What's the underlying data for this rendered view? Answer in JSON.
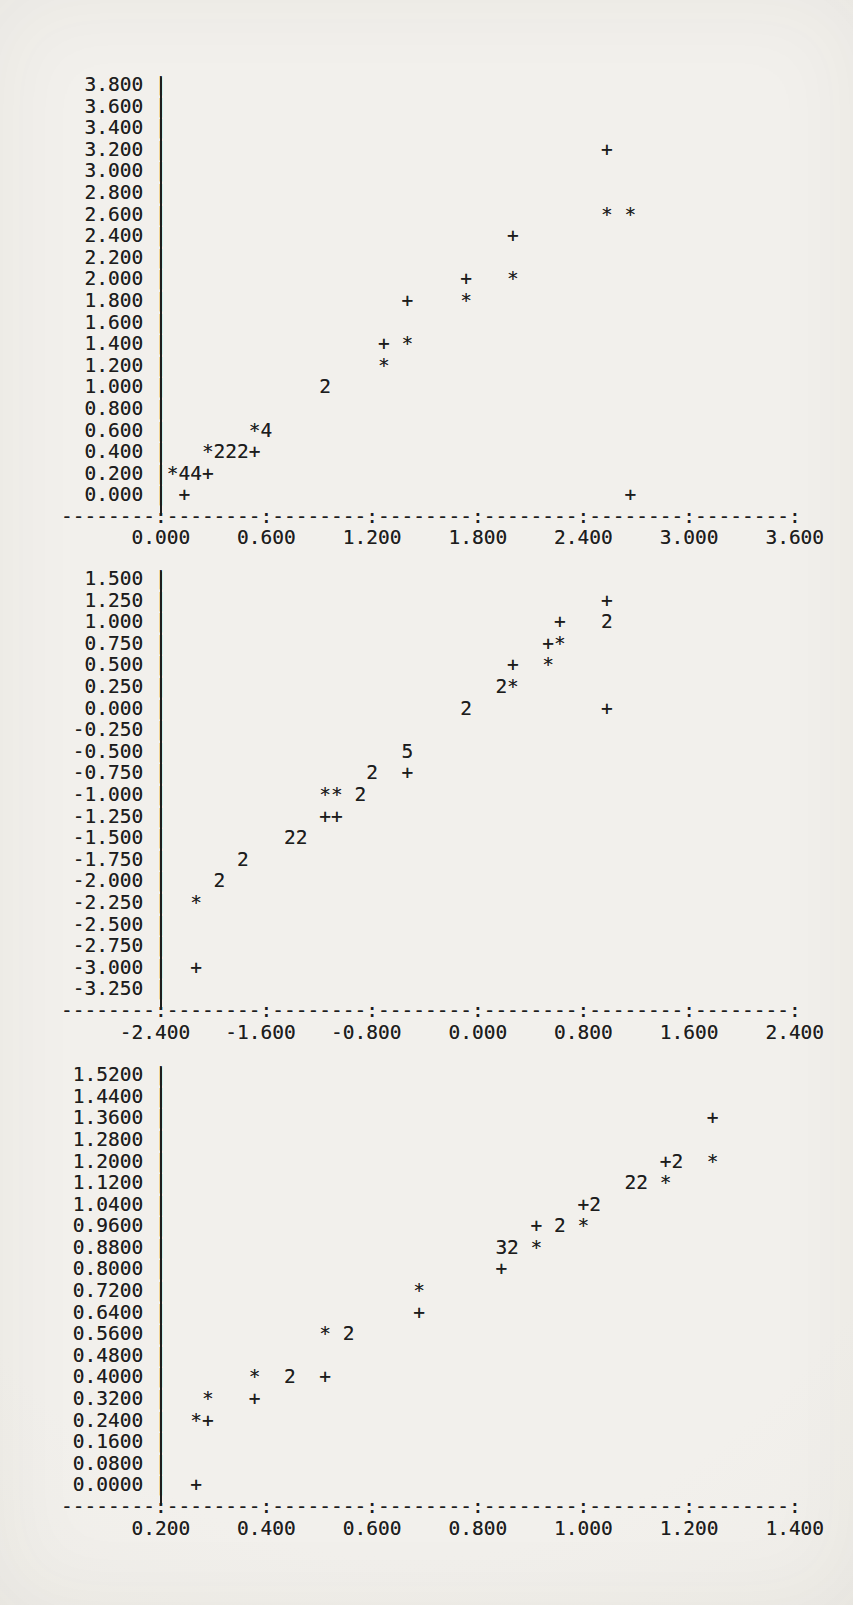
{
  "page": {
    "background": "#f0eeea",
    "ink": "#1d1d1d"
  },
  "plots": [
    {
      "id": "plot-1",
      "axis_line": "--------:--------:--------:--------:--------:--------:--------:",
      "x_label_line": "      0.000    0.600    1.200    1.800    2.400    3.000    3.600",
      "rows": [
        {
          "label": "3.800",
          "marks": []
        },
        {
          "label": "3.600",
          "marks": []
        },
        {
          "label": "3.400",
          "marks": []
        },
        {
          "label": "3.200",
          "marks": [
            [
              46,
              "+"
            ]
          ]
        },
        {
          "label": "3.000",
          "marks": []
        },
        {
          "label": "2.800",
          "marks": []
        },
        {
          "label": "2.600",
          "marks": [
            [
              46,
              "*"
            ],
            [
              48,
              "*"
            ]
          ]
        },
        {
          "label": "2.400",
          "marks": [
            [
              38,
              "+"
            ]
          ]
        },
        {
          "label": "2.200",
          "marks": []
        },
        {
          "label": "2.000",
          "marks": [
            [
              34,
              "+"
            ],
            [
              38,
              "*"
            ]
          ]
        },
        {
          "label": "1.800",
          "marks": [
            [
              29,
              "+"
            ],
            [
              34,
              "*"
            ]
          ]
        },
        {
          "label": "1.600",
          "marks": []
        },
        {
          "label": "1.400",
          "marks": [
            [
              27,
              "+"
            ],
            [
              29,
              "*"
            ]
          ]
        },
        {
          "label": "1.200",
          "marks": [
            [
              27,
              "*"
            ]
          ]
        },
        {
          "label": "1.000",
          "marks": [
            [
              22,
              "2"
            ]
          ]
        },
        {
          "label": "0.800",
          "marks": []
        },
        {
          "label": "0.600",
          "marks": [
            [
              16,
              "*4"
            ]
          ]
        },
        {
          "label": "0.400",
          "marks": [
            [
              12,
              "*222+"
            ]
          ]
        },
        {
          "label": "0.200",
          "marks": [
            [
              9,
              "*44+"
            ]
          ]
        },
        {
          "label": "0.000",
          "marks": [
            [
              10,
              "+"
            ],
            [
              48,
              "+"
            ]
          ]
        }
      ]
    },
    {
      "id": "plot-2",
      "axis_line": "--------:--------:--------:--------:--------:--------:--------:",
      "x_label_line": "     -2.400   -1.600   -0.800    0.000    0.800    1.600    2.400",
      "rows": [
        {
          "label": "1.500",
          "marks": []
        },
        {
          "label": "1.250",
          "marks": [
            [
              46,
              "+"
            ]
          ]
        },
        {
          "label": "1.000",
          "marks": [
            [
              42,
              "+"
            ],
            [
              46,
              "2"
            ]
          ]
        },
        {
          "label": "0.750",
          "marks": [
            [
              41,
              "+*"
            ]
          ]
        },
        {
          "label": "0.500",
          "marks": [
            [
              38,
              "+"
            ],
            [
              41,
              "*"
            ]
          ]
        },
        {
          "label": "0.250",
          "marks": [
            [
              37,
              "2*"
            ]
          ]
        },
        {
          "label": "0.000",
          "marks": [
            [
              34,
              "2"
            ],
            [
              46,
              "+"
            ]
          ]
        },
        {
          "label": "-0.250",
          "marks": []
        },
        {
          "label": "-0.500",
          "marks": [
            [
              29,
              "5"
            ]
          ]
        },
        {
          "label": "-0.750",
          "marks": [
            [
              26,
              "2"
            ],
            [
              29,
              "+"
            ]
          ]
        },
        {
          "label": "-1.000",
          "marks": [
            [
              22,
              "**"
            ],
            [
              25,
              "2"
            ]
          ]
        },
        {
          "label": "-1.250",
          "marks": [
            [
              22,
              "++"
            ]
          ]
        },
        {
          "label": "-1.500",
          "marks": [
            [
              19,
              "22"
            ]
          ]
        },
        {
          "label": "-1.750",
          "marks": [
            [
              15,
              "2"
            ]
          ]
        },
        {
          "label": "-2.000",
          "marks": [
            [
              13,
              "2"
            ]
          ]
        },
        {
          "label": "-2.250",
          "marks": [
            [
              11,
              "*"
            ]
          ]
        },
        {
          "label": "-2.500",
          "marks": []
        },
        {
          "label": "-2.750",
          "marks": []
        },
        {
          "label": "-3.000",
          "marks": [
            [
              11,
              "+"
            ]
          ]
        },
        {
          "label": "-3.250",
          "marks": []
        }
      ]
    },
    {
      "id": "plot-3",
      "axis_line": "--------:--------:--------:--------:--------:--------:--------:",
      "x_label_line": "      0.200    0.400    0.600    0.800    1.000    1.200    1.400",
      "rows": [
        {
          "label": "1.5200",
          "marks": []
        },
        {
          "label": "1.4400",
          "marks": []
        },
        {
          "label": "1.3600",
          "marks": [
            [
              55,
              "+"
            ]
          ]
        },
        {
          "label": "1.2800",
          "marks": []
        },
        {
          "label": "1.2000",
          "marks": [
            [
              51,
              "+2"
            ],
            [
              55,
              "*"
            ]
          ]
        },
        {
          "label": "1.1200",
          "marks": [
            [
              48,
              "22"
            ],
            [
              51,
              "*"
            ]
          ]
        },
        {
          "label": "1.0400",
          "marks": [
            [
              44,
              "+2"
            ]
          ]
        },
        {
          "label": "0.9600",
          "marks": [
            [
              40,
              "+"
            ],
            [
              42,
              "2"
            ],
            [
              44,
              "*"
            ]
          ]
        },
        {
          "label": "0.8800",
          "marks": [
            [
              37,
              "32"
            ],
            [
              40,
              "*"
            ]
          ]
        },
        {
          "label": "0.8000",
          "marks": [
            [
              37,
              "+"
            ]
          ]
        },
        {
          "label": "0.7200",
          "marks": [
            [
              30,
              "*"
            ]
          ]
        },
        {
          "label": "0.6400",
          "marks": [
            [
              30,
              "+"
            ]
          ]
        },
        {
          "label": "0.5600",
          "marks": [
            [
              22,
              "*"
            ],
            [
              24,
              "2"
            ]
          ]
        },
        {
          "label": "0.4800",
          "marks": []
        },
        {
          "label": "0.4000",
          "marks": [
            [
              16,
              "*"
            ],
            [
              19,
              "2"
            ],
            [
              22,
              "+"
            ]
          ]
        },
        {
          "label": "0.3200",
          "marks": [
            [
              12,
              "*"
            ],
            [
              16,
              "+"
            ]
          ]
        },
        {
          "label": "0.2400",
          "marks": [
            [
              11,
              "*+"
            ]
          ]
        },
        {
          "label": "0.1600",
          "marks": []
        },
        {
          "label": "0.0800",
          "marks": []
        },
        {
          "label": "0.0000",
          "marks": [
            [
              11,
              "+"
            ]
          ]
        }
      ]
    }
  ],
  "chart_data": [
    {
      "type": "scatter",
      "title": "",
      "xlabel": "",
      "ylabel": "",
      "xlim": [
        0.0,
        3.6
      ],
      "ylim": [
        0.0,
        3.8
      ],
      "x_ticks": [
        0.0,
        0.6,
        1.2,
        1.8,
        2.4,
        3.0,
        3.6
      ],
      "y_ticks": [
        3.8,
        3.6,
        3.4,
        3.2,
        3.0,
        2.8,
        2.6,
        2.4,
        2.2,
        2.0,
        1.8,
        1.6,
        1.4,
        1.2,
        1.0,
        0.8,
        0.6,
        0.4,
        0.2,
        0.0
      ],
      "grid": false,
      "legend": "none",
      "marker_note": "printer plot: + and * are single points; a digit n marks n coincident points",
      "point_format": "[x, y, marker]",
      "points": [
        [
          2.53,
          3.2,
          "+"
        ],
        [
          2.53,
          2.6,
          "*"
        ],
        [
          2.67,
          2.6,
          "*"
        ],
        [
          2.0,
          2.4,
          "+"
        ],
        [
          1.73,
          2.0,
          "+"
        ],
        [
          2.0,
          2.0,
          "*"
        ],
        [
          1.4,
          1.8,
          "+"
        ],
        [
          1.73,
          1.8,
          "*"
        ],
        [
          1.27,
          1.4,
          "+"
        ],
        [
          1.4,
          1.4,
          "*"
        ],
        [
          1.27,
          1.2,
          "*"
        ],
        [
          0.93,
          1.0,
          "2"
        ],
        [
          0.53,
          0.6,
          "*"
        ],
        [
          0.6,
          0.6,
          "4"
        ],
        [
          0.27,
          0.4,
          "*"
        ],
        [
          0.33,
          0.4,
          "2"
        ],
        [
          0.4,
          0.4,
          "2"
        ],
        [
          0.47,
          0.4,
          "2"
        ],
        [
          0.53,
          0.4,
          "+"
        ],
        [
          0.07,
          0.2,
          "*"
        ],
        [
          0.13,
          0.2,
          "4"
        ],
        [
          0.2,
          0.2,
          "4"
        ],
        [
          0.27,
          0.2,
          "+"
        ],
        [
          0.13,
          0.0,
          "+"
        ],
        [
          2.67,
          0.0,
          "+"
        ]
      ]
    },
    {
      "type": "scatter",
      "title": "",
      "xlabel": "",
      "ylabel": "",
      "xlim": [
        -2.4,
        2.4
      ],
      "ylim": [
        -3.25,
        1.5
      ],
      "x_ticks": [
        -2.4,
        -1.6,
        -0.8,
        0.0,
        0.8,
        1.6,
        2.4
      ],
      "y_ticks": [
        1.5,
        1.25,
        1.0,
        0.75,
        0.5,
        0.25,
        0.0,
        -0.25,
        -0.5,
        -0.75,
        -1.0,
        -1.25,
        -1.5,
        -1.75,
        -2.0,
        -2.25,
        -2.5,
        -2.75,
        -3.0,
        -3.25
      ],
      "grid": false,
      "legend": "none",
      "marker_note": "printer plot: + and * are single points; a digit n marks n coincident points",
      "point_format": "[x, y, marker]",
      "points": [
        [
          0.98,
          1.25,
          "+"
        ],
        [
          0.62,
          1.0,
          "+"
        ],
        [
          0.98,
          1.0,
          "2"
        ],
        [
          0.53,
          0.75,
          "+"
        ],
        [
          0.62,
          0.75,
          "*"
        ],
        [
          0.27,
          0.5,
          "+"
        ],
        [
          0.53,
          0.5,
          "*"
        ],
        [
          0.18,
          0.25,
          "2"
        ],
        [
          0.27,
          0.25,
          "*"
        ],
        [
          -0.09,
          0.0,
          "2"
        ],
        [
          0.98,
          0.0,
          "+"
        ],
        [
          -0.53,
          -0.5,
          "5"
        ],
        [
          -0.8,
          -0.75,
          "2"
        ],
        [
          -0.53,
          -0.75,
          "+"
        ],
        [
          -1.16,
          -1.0,
          "*"
        ],
        [
          -1.07,
          -1.0,
          "*"
        ],
        [
          -0.89,
          -1.0,
          "2"
        ],
        [
          -1.16,
          -1.25,
          "+"
        ],
        [
          -1.07,
          -1.25,
          "+"
        ],
        [
          -1.42,
          -1.5,
          "2"
        ],
        [
          -1.33,
          -1.5,
          "2"
        ],
        [
          -1.78,
          -1.75,
          "2"
        ],
        [
          -1.96,
          -2.0,
          "2"
        ],
        [
          -2.13,
          -2.25,
          "*"
        ],
        [
          -2.13,
          -3.0,
          "+"
        ]
      ]
    },
    {
      "type": "scatter",
      "title": "",
      "xlabel": "",
      "ylabel": "",
      "xlim": [
        0.2,
        1.4
      ],
      "ylim": [
        0.0,
        1.52
      ],
      "x_ticks": [
        0.2,
        0.4,
        0.6,
        0.8,
        1.0,
        1.2,
        1.4
      ],
      "y_ticks": [
        1.52,
        1.44,
        1.36,
        1.28,
        1.2,
        1.12,
        1.04,
        0.96,
        0.88,
        0.8,
        0.72,
        0.64,
        0.56,
        0.48,
        0.4,
        0.32,
        0.24,
        0.16,
        0.08,
        0.0
      ],
      "grid": false,
      "legend": "none",
      "marker_note": "printer plot: + and * are single points; a digit n marks n coincident points",
      "point_format": "[x, y, marker]",
      "points": [
        [
          1.24,
          1.36,
          "+"
        ],
        [
          1.16,
          1.2,
          "+"
        ],
        [
          1.18,
          1.2,
          "2"
        ],
        [
          1.24,
          1.2,
          "*"
        ],
        [
          1.09,
          1.12,
          "2"
        ],
        [
          1.11,
          1.12,
          "2"
        ],
        [
          1.16,
          1.12,
          "*"
        ],
        [
          1.0,
          1.04,
          "+"
        ],
        [
          1.02,
          1.04,
          "2"
        ],
        [
          0.91,
          0.96,
          "+"
        ],
        [
          0.96,
          0.96,
          "2"
        ],
        [
          1.0,
          0.96,
          "*"
        ],
        [
          0.84,
          0.88,
          "3"
        ],
        [
          0.87,
          0.88,
          "2"
        ],
        [
          0.91,
          0.88,
          "*"
        ],
        [
          0.84,
          0.8,
          "+"
        ],
        [
          0.69,
          0.72,
          "*"
        ],
        [
          0.69,
          0.64,
          "+"
        ],
        [
          0.51,
          0.56,
          "*"
        ],
        [
          0.56,
          0.56,
          "2"
        ],
        [
          0.38,
          0.4,
          "*"
        ],
        [
          0.44,
          0.4,
          "2"
        ],
        [
          0.51,
          0.4,
          "+"
        ],
        [
          0.29,
          0.32,
          "*"
        ],
        [
          0.38,
          0.32,
          "+"
        ],
        [
          0.27,
          0.24,
          "*"
        ],
        [
          0.29,
          0.24,
          "+"
        ],
        [
          0.27,
          0.0,
          "+"
        ]
      ]
    }
  ]
}
